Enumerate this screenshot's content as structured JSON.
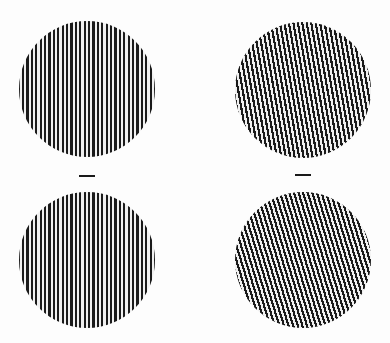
{
  "figure": {
    "colors": {
      "background": "#fdfdfd",
      "stripe_dark": "#1a1a1a",
      "stripe_light": "#f0f0f0"
    },
    "gratings": [
      {
        "id": "top-left",
        "cx": 87,
        "cy": 89,
        "radius": 68,
        "tilt_deg": 0,
        "period_px": 4.4
      },
      {
        "id": "top-right",
        "cx": 303,
        "cy": 90,
        "radius": 68,
        "tilt_deg": -10,
        "period_px": 4.4
      },
      {
        "id": "bottom-left",
        "cx": 87,
        "cy": 260,
        "radius": 68,
        "tilt_deg": 0,
        "period_px": 4.4
      },
      {
        "id": "bottom-right",
        "cx": 303,
        "cy": 260,
        "radius": 68,
        "tilt_deg": -17,
        "period_px": 4.4
      }
    ],
    "fixation_marks": [
      {
        "id": "left",
        "x": 79,
        "y": 175,
        "width": 16
      },
      {
        "id": "right",
        "x": 295,
        "y": 174,
        "width": 16
      }
    ]
  }
}
